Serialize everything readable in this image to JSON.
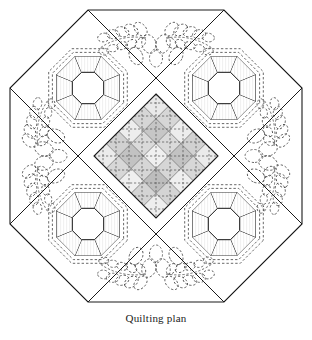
{
  "figure": {
    "caption": "Quilting plan",
    "title": "Quilting plan",
    "shape": "octagon"
  },
  "colors": {
    "outline": "#1a1a1a",
    "background": "#ffffff",
    "piece_light": "#ebebeb",
    "piece_mid": "#d6d6d6",
    "piece_dark": "#c2c2c2",
    "plaid_light": "#eeeeee",
    "plaid_mid": "#dcdcdc",
    "plaid_dark": "#c9c9c9",
    "quilting_dash": "#4d4d4d",
    "grid_line": "#555555"
  },
  "geometry": {
    "octagon_points": "88,10 224,10 302,88 302,224 224,302 88,302 10,224 10,88",
    "diagonals": [
      "88,10 10,88",
      "224,10 302,88",
      "302,224 224,302",
      "88,302 10,224"
    ],
    "center_diamond": {
      "cx": 156,
      "cy": 156,
      "half_diagonal": 62,
      "cells_per_side": 5
    }
  },
  "blocks": [
    {
      "name": "ring-block-top-left",
      "cx": 88,
      "cy": 88,
      "label": "Top left ring block",
      "ring_radius": 34,
      "inner_radius": 17
    },
    {
      "name": "ring-block-top-right",
      "cx": 224,
      "cy": 88,
      "label": "Top right ring block",
      "ring_radius": 34,
      "inner_radius": 17
    },
    {
      "name": "ring-block-bottom-left",
      "cx": 88,
      "cy": 224,
      "label": "Bottom left ring block",
      "ring_radius": 34,
      "inner_radius": 17
    },
    {
      "name": "ring-block-bottom-right",
      "cx": 224,
      "cy": 224,
      "label": "Bottom right ring block",
      "ring_radius": 34,
      "inner_radius": 17
    }
  ],
  "ring_segment_shades": [
    "#dcdcdc",
    "#ececec",
    "#cfcfcf",
    "#e4e4e4",
    "#d4d4d4",
    "#ededed",
    "#c9c9c9",
    "#e0e0e0"
  ],
  "feather_motifs": [
    {
      "name": "feather-motif-top",
      "cx": 156,
      "cy": 42,
      "rotation": 0,
      "label": "Top feather quilting motif"
    },
    {
      "name": "feather-motif-left",
      "cx": 42,
      "cy": 156,
      "rotation": 270,
      "label": "Left feather quilting motif"
    },
    {
      "name": "feather-motif-right",
      "cx": 270,
      "cy": 156,
      "rotation": 90,
      "label": "Right feather quilting motif"
    },
    {
      "name": "feather-motif-bottom",
      "cx": 156,
      "cy": 270,
      "rotation": 180,
      "label": "Bottom feather quilting motif"
    }
  ],
  "plaid": {
    "bands": [
      0,
      1,
      2,
      3,
      4
    ],
    "band_shades": [
      "#ededed",
      "#d9d9d9",
      "#e6e6e6",
      "#d2d2d2",
      "#eeeeee"
    ],
    "quilt_line_count": 9
  }
}
